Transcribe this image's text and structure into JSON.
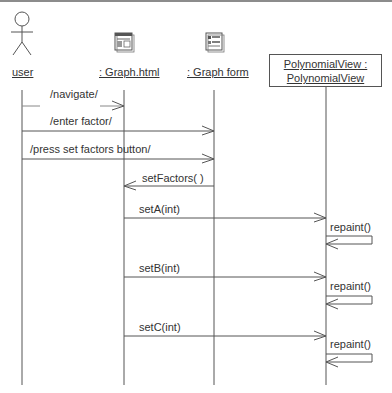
{
  "diagram": {
    "type": "uml-sequence",
    "lifelines": [
      {
        "id": "user",
        "label": "user",
        "kind": "actor",
        "x": 22
      },
      {
        "id": "graph_html",
        "label": ": Graph.html",
        "kind": "web-page",
        "x": 124
      },
      {
        "id": "graph_form",
        "label": ": Graph form",
        "kind": "web-form",
        "x": 214
      },
      {
        "id": "polyview",
        "label_line1": "PolynomialView :",
        "label_line2": "PolynomialView",
        "kind": "object",
        "x": 326
      }
    ],
    "messages": [
      {
        "label": "/navigate/",
        "from": "user",
        "to": "graph_html",
        "y": 106
      },
      {
        "label": "/enter factor/",
        "from": "user",
        "to": "graph_form",
        "y": 131
      },
      {
        "label": "/press set factors button/",
        "from": "user",
        "to": "graph_form",
        "y": 159
      },
      {
        "label": "setFactors( )",
        "from": "graph_form",
        "to": "graph_html",
        "y": 186
      },
      {
        "label": "setA(int)",
        "from": "graph_html",
        "to": "polyview",
        "y": 218
      },
      {
        "label": "repaint()",
        "from": "polyview",
        "to": "polyview",
        "self": true,
        "y": 234
      },
      {
        "label": "setB(int)",
        "from": "graph_html",
        "to": "polyview",
        "y": 277
      },
      {
        "label": "repaint()",
        "from": "polyview",
        "to": "polyview",
        "self": true,
        "y": 294
      },
      {
        "label": "setC(int)",
        "from": "graph_html",
        "to": "polyview",
        "y": 336
      },
      {
        "label": "repaint()",
        "from": "polyview",
        "to": "polyview",
        "self": true,
        "y": 352
      }
    ]
  }
}
